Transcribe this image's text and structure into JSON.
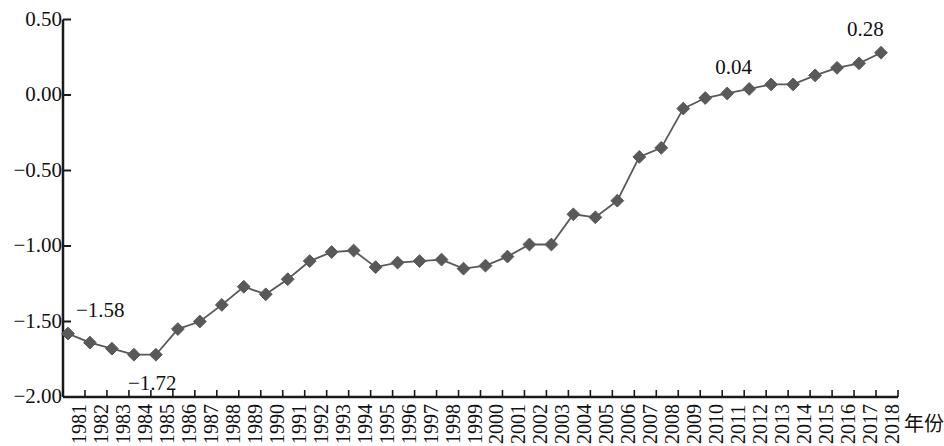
{
  "chart_data": {
    "type": "line",
    "title": "",
    "subtitle": "",
    "xlabel": "年份",
    "ylabel": "",
    "grid": false,
    "legend": "none",
    "marker": "diamond",
    "series_color": "#595959",
    "axis_color": "#1a1a1a",
    "ylim": [
      -2.0,
      0.5
    ],
    "ytick_labels": [
      "0.50",
      "0.00",
      "−0.50",
      "−1.00",
      "−1.50",
      "−2.00"
    ],
    "ytick_values": [
      0.5,
      0.0,
      -0.5,
      -1.0,
      -1.5,
      -2.0
    ],
    "categories": [
      "1981",
      "1982",
      "1983",
      "1984",
      "1985",
      "1986",
      "1987",
      "1988",
      "1989",
      "1990",
      "1991",
      "1992",
      "1993",
      "1994",
      "1995",
      "1996",
      "1997",
      "1998",
      "1999",
      "2000",
      "2001",
      "2002",
      "2003",
      "2004",
      "2005",
      "2006",
      "2007",
      "2008",
      "2009",
      "2010",
      "2011",
      "2012",
      "2013",
      "2014",
      "2015",
      "2016",
      "2017",
      "2018"
    ],
    "values": [
      -1.58,
      -1.64,
      -1.68,
      -1.72,
      -1.72,
      -1.55,
      -1.5,
      -1.39,
      -1.27,
      -1.32,
      -1.22,
      -1.1,
      -1.04,
      -1.03,
      -1.14,
      -1.11,
      -1.1,
      -1.09,
      -1.15,
      -1.13,
      -1.07,
      -0.99,
      -0.99,
      -0.79,
      -0.81,
      -0.7,
      -0.41,
      -0.35,
      -0.09,
      -0.02,
      0.01,
      0.04,
      0.07,
      0.07,
      0.13,
      0.18,
      0.21,
      0.28
    ],
    "annotations": [
      {
        "label": "−1.58",
        "year": "1981",
        "value": -1.58
      },
      {
        "label": "−1.72",
        "year": "1984",
        "value": -1.72
      },
      {
        "label": "0.04",
        "year": "2012",
        "value": 0.04
      },
      {
        "label": "0.28",
        "year": "2018",
        "value": 0.28
      }
    ]
  }
}
